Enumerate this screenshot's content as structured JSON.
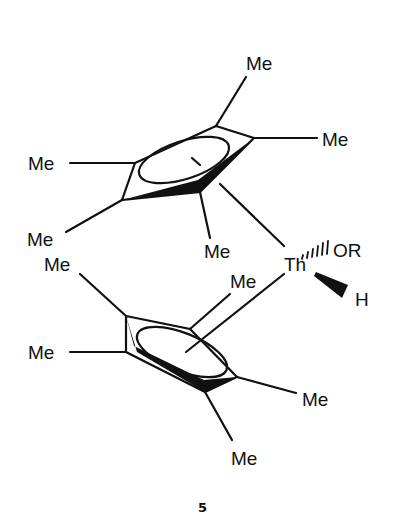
{
  "diagram": {
    "compound_number": "5",
    "metal": "Th",
    "ligands": {
      "alkoxide": "OR",
      "hydride": "H",
      "methyl_label": "Me"
    },
    "upper_ring_methyls": [
      "Me",
      "Me",
      "Me",
      "Me",
      "Me"
    ],
    "lower_ring_methyls": [
      "Me",
      "Me",
      "Me",
      "Me",
      "Me"
    ]
  }
}
